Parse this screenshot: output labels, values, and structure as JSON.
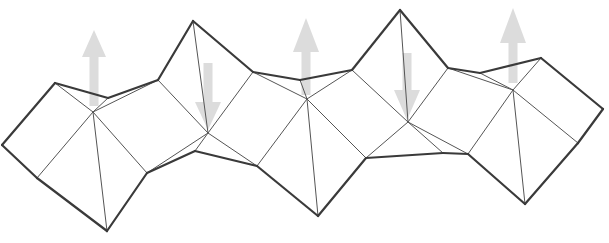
{
  "diagram": {
    "colors": {
      "background": "#ffffff",
      "thick_edge": "#3a3a3a",
      "thin_edge": "#555555",
      "arrow_fill": "#d9d9d9"
    },
    "vertices": {
      "A": [
        55,
        83
      ],
      "B": [
        2,
        145
      ],
      "C": [
        37,
        178
      ],
      "D": [
        93,
        112
      ],
      "E": [
        108,
        98
      ],
      "F": [
        158,
        80
      ],
      "G": [
        107,
        231
      ],
      "H": [
        147,
        173
      ],
      "I": [
        208,
        133
      ],
      "P": [
        193,
        21
      ],
      "K": [
        253,
        72
      ],
      "N2": [
        195,
        151
      ],
      "L": [
        257,
        166
      ],
      "M": [
        307,
        99
      ],
      "N3": [
        300,
        80
      ],
      "Q": [
        352,
        70
      ],
      "R": [
        318,
        216
      ],
      "S": [
        366,
        158
      ],
      "T": [
        400,
        10
      ],
      "U": [
        448,
        68
      ],
      "V": [
        408,
        122
      ],
      "N4": [
        443,
        153
      ],
      "W": [
        468,
        154
      ],
      "X": [
        513,
        90
      ],
      "N5": [
        480,
        73
      ],
      "Y": [
        541,
        58
      ],
      "AA": [
        525,
        204
      ],
      "AB": [
        578,
        143
      ],
      "AC": [
        603,
        109
      ]
    },
    "thick_edges": [
      [
        "A",
        "B"
      ],
      [
        "B",
        "C"
      ],
      [
        "A",
        "E"
      ],
      [
        "E",
        "F"
      ],
      [
        "C",
        "G"
      ],
      [
        "G",
        "H"
      ],
      [
        "F",
        "P"
      ],
      [
        "P",
        "K"
      ],
      [
        "H",
        "N2"
      ],
      [
        "N2",
        "L"
      ],
      [
        "K",
        "N3"
      ],
      [
        "N3",
        "Q"
      ],
      [
        "L",
        "R"
      ],
      [
        "R",
        "S"
      ],
      [
        "Q",
        "T"
      ],
      [
        "T",
        "U"
      ],
      [
        "S",
        "N4"
      ],
      [
        "N4",
        "W"
      ],
      [
        "U",
        "N5"
      ],
      [
        "N5",
        "Y"
      ],
      [
        "W",
        "AA"
      ],
      [
        "AA",
        "AB"
      ],
      [
        "Y",
        "AC"
      ],
      [
        "AC",
        "AB"
      ]
    ],
    "thin_edges": [
      [
        "C",
        "D"
      ],
      [
        "A",
        "D"
      ],
      [
        "D",
        "E"
      ],
      [
        "D",
        "F"
      ],
      [
        "D",
        "G"
      ],
      [
        "D",
        "H"
      ],
      [
        "F",
        "I"
      ],
      [
        "H",
        "I"
      ],
      [
        "P",
        "I"
      ],
      [
        "I",
        "N2"
      ],
      [
        "I",
        "K"
      ],
      [
        "I",
        "L"
      ],
      [
        "K",
        "M"
      ],
      [
        "L",
        "M"
      ],
      [
        "N3",
        "M"
      ],
      [
        "M",
        "Q"
      ],
      [
        "M",
        "R"
      ],
      [
        "M",
        "S"
      ],
      [
        "T",
        "V"
      ],
      [
        "Q",
        "V"
      ],
      [
        "V",
        "S"
      ],
      [
        "V",
        "N4"
      ],
      [
        "V",
        "W"
      ],
      [
        "U",
        "V"
      ],
      [
        "W",
        "X"
      ],
      [
        "U",
        "X"
      ],
      [
        "N5",
        "X"
      ],
      [
        "X",
        "Y"
      ],
      [
        "X",
        "AA"
      ],
      [
        "X",
        "AB"
      ]
    ],
    "arrows": [
      {
        "direction": "up",
        "x": 94,
        "tip_y": 30,
        "tail_y": 106,
        "head_base_y": 57,
        "head_half_width": 12,
        "shaft_half_width": 4.5
      },
      {
        "direction": "down",
        "x": 208,
        "tip_y": 130,
        "tail_y": 63,
        "head_base_y": 102,
        "head_half_width": 13,
        "shaft_half_width": 4.5
      },
      {
        "direction": "up",
        "x": 306,
        "tip_y": 18,
        "tail_y": 95,
        "head_base_y": 52,
        "head_half_width": 13,
        "shaft_half_width": 4.5
      },
      {
        "direction": "down",
        "x": 407,
        "tip_y": 120,
        "tail_y": 53,
        "head_base_y": 90,
        "head_half_width": 13,
        "shaft_half_width": 4.5
      },
      {
        "direction": "up",
        "x": 513,
        "tip_y": 8,
        "tail_y": 83,
        "head_base_y": 43,
        "head_half_width": 13,
        "shaft_half_width": 4.5
      }
    ]
  }
}
